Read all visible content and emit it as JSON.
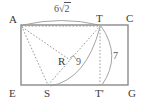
{
  "figure": {
    "type": "geometry-diagram",
    "colors": {
      "rectangle_stroke": "#8a8a8a",
      "dotted_stroke": "#9a9a9a",
      "arc_stroke": "#9a9a9a",
      "label_text": "#3a3a3a",
      "measure_text": "#555555",
      "background": "#ffffff"
    },
    "vertices": [
      {
        "id": "A",
        "label": "A",
        "x": 21,
        "y": 25
      },
      {
        "id": "T",
        "label": "T",
        "x": 100,
        "y": 25
      },
      {
        "id": "C",
        "label": "C",
        "x": 128,
        "y": 25
      },
      {
        "id": "E",
        "label": "E",
        "x": 21,
        "y": 85
      },
      {
        "id": "S",
        "label": "S",
        "x": 48,
        "y": 85
      },
      {
        "id": "Tprime",
        "label": "T'",
        "x": 100,
        "y": 85
      },
      {
        "id": "G",
        "label": "G",
        "x": 128,
        "y": 85
      }
    ],
    "measurements": [
      {
        "id": "top",
        "value": "6",
        "radical_arg": "2",
        "has_radical": true,
        "x": 64,
        "y": 9
      },
      {
        "id": "middle",
        "value": "9",
        "has_radical": false,
        "x": 79,
        "y": 62
      },
      {
        "id": "right",
        "value": "7",
        "has_radical": false,
        "x": 115,
        "y": 56
      }
    ],
    "point_labels": [
      {
        "id": "R",
        "label": "R",
        "x": 61,
        "y": 62
      }
    ],
    "right_angle_marker": {
      "present": true,
      "x": 73,
      "y": 57
    }
  }
}
